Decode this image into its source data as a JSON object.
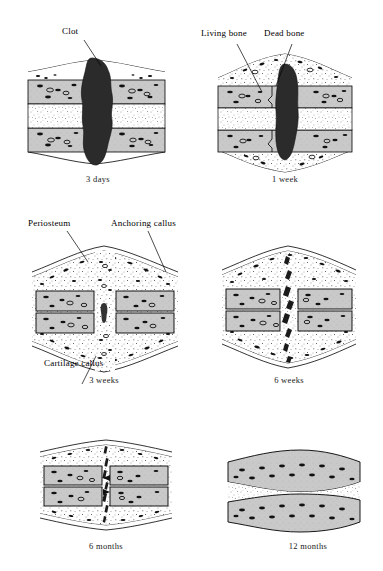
{
  "figure": {
    "panels": [
      {
        "id": "three-days",
        "caption": "3 days",
        "stage_index": 1,
        "labels": [
          {
            "text": "Clot",
            "target": "hematoma"
          }
        ],
        "features": {
          "clot": true,
          "gap_type": "large-hematoma",
          "callus": "none",
          "periosteum_bulge": "slight"
        }
      },
      {
        "id": "one-week",
        "caption": "1 week",
        "stage_index": 2,
        "labels": [
          {
            "text": "Living bone",
            "target": "cortex-viable"
          },
          {
            "text": "Dead bone",
            "target": "cortex-necrotic"
          }
        ],
        "features": {
          "clot": true,
          "gap_type": "narrowing-hematoma",
          "callus": "soft-forming",
          "periosteum_bulge": "moderate"
        }
      },
      {
        "id": "three-weeks",
        "caption": "3 weeks",
        "stage_index": 3,
        "labels": [
          {
            "text": "Periosteum",
            "target": "periosteum"
          },
          {
            "text": "Anchoring callus",
            "target": "anchoring-callus"
          },
          {
            "text": "Cartilage callus",
            "target": "cartilage-callus"
          }
        ],
        "features": {
          "clot": false,
          "gap_type": "cartilage-bridge",
          "callus": "large-soft",
          "periosteum_bulge": "large"
        }
      },
      {
        "id": "six-weeks",
        "caption": "6 weeks",
        "stage_index": 4,
        "labels": [],
        "features": {
          "clot": false,
          "gap_type": "bony-bridging",
          "callus": "hard-bony",
          "periosteum_bulge": "large"
        }
      },
      {
        "id": "six-months",
        "caption": "6 months",
        "stage_index": 5,
        "labels": [],
        "features": {
          "clot": false,
          "gap_type": "thin-fracture-line",
          "callus": "remodeling",
          "periosteum_bulge": "small"
        }
      },
      {
        "id": "twelve-months",
        "caption": "12 months",
        "stage_index": 6,
        "labels": [],
        "features": {
          "clot": false,
          "gap_type": "none",
          "callus": "remodeled",
          "periosteum_bulge": "none"
        }
      }
    ]
  },
  "colors": {
    "page_background": "#ffffff",
    "ink": "#000000",
    "cortex_fill": "#c9c9c9",
    "clot_fill": "#2b2b2b",
    "marrow_fill": "#ffffff",
    "stipple": "#3a3a3a"
  }
}
